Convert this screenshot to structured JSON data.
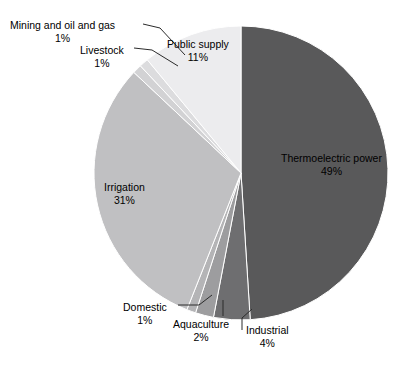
{
  "chart_data": {
    "type": "pie",
    "title": "",
    "subtitle": "",
    "xlabel": "",
    "ylabel": "",
    "legend_position": "none",
    "grid": false,
    "units": "percent",
    "total": 100,
    "start_angle_deg": 0,
    "direction": "clockwise",
    "categories": [
      "Thermoelectric power",
      "Industrial",
      "Aquaculture",
      "Domestic",
      "Irrigation",
      "Livestock",
      "Mining and oil and gas",
      "Public supply"
    ],
    "values": [
      49,
      4,
      2,
      1,
      31,
      1,
      1,
      11
    ],
    "slices": [
      {
        "label": "Thermoelectric power",
        "percent_text": "49%",
        "value": 49,
        "color": "#59595a",
        "label_placement": "inside",
        "leader_line": false
      },
      {
        "label": "Industrial",
        "percent_text": "4%",
        "value": 4,
        "color": "#6e6e70",
        "label_placement": "outside",
        "leader_line": true
      },
      {
        "label": "Aquaculture",
        "percent_text": "2%",
        "value": 2,
        "color": "#9d9d9f",
        "label_placement": "outside",
        "leader_line": true
      },
      {
        "label": "Domestic",
        "percent_text": "1%",
        "value": 1,
        "color": "#b4b4b6",
        "label_placement": "outside",
        "leader_line": true
      },
      {
        "label": "Irrigation",
        "percent_text": "31%",
        "value": 31,
        "color": "#c0c0c2",
        "label_placement": "inside",
        "leader_line": false
      },
      {
        "label": "Livestock",
        "percent_text": "1%",
        "value": 1,
        "color": "#d2d2d4",
        "label_placement": "outside",
        "leader_line": true
      },
      {
        "label": "Mining and oil and gas",
        "percent_text": "1%",
        "value": 1,
        "color": "#dcdcde",
        "label_placement": "outside",
        "leader_line": true
      },
      {
        "label": "Public supply",
        "percent_text": "11%",
        "value": 11,
        "color": "#ececee",
        "label_placement": "inside",
        "leader_line": false
      }
    ]
  },
  "labels": {
    "mining": {
      "name": "Mining and oil and gas",
      "percent": "1%"
    },
    "livestock": {
      "name": "Livestock",
      "percent": "1%"
    },
    "public_supply": {
      "name": "Public supply",
      "percent": "11%"
    },
    "thermoelectric": {
      "name": "Thermoelectric power",
      "percent": "49%"
    },
    "irrigation": {
      "name": "Irrigation",
      "percent": "31%"
    },
    "domestic": {
      "name": "Domestic",
      "percent": "1%"
    },
    "aquaculture": {
      "name": "Aquaculture",
      "percent": "2%"
    },
    "industrial": {
      "name": "Industrial",
      "percent": "4%"
    }
  },
  "style": {
    "background": "#ffffff",
    "slice_separator": "#ffffff",
    "text_color": "#000000",
    "leader_line_color": "#2b2b2b"
  }
}
